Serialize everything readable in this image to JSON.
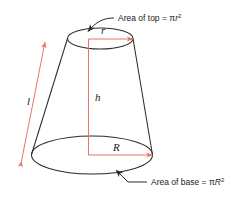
{
  "figure": {
    "name": "truncated-cone-frustum-diagram",
    "colors": {
      "outline": "#2b2b2b",
      "dimension": "#e8736b",
      "text": "#1a1a1a",
      "background": "#ffffff"
    }
  },
  "callouts": {
    "top": {
      "prefix": "Area of top = π",
      "variable": "r",
      "exponent": "2",
      "full_text": "Area of top = πr²"
    },
    "base": {
      "prefix": "Area of base = π",
      "variable": "R",
      "exponent": "2",
      "full_text": "Area of base = πR²"
    }
  },
  "dimensions": {
    "slant_height": "l",
    "height": "h",
    "top_radius": "r",
    "base_radius": "R"
  }
}
